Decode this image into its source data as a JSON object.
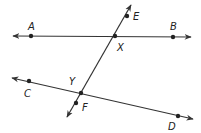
{
  "diagram": {
    "type": "geometry-lines",
    "colors": {
      "line": "#333333",
      "point": "#222222",
      "background": "#ffffff"
    },
    "lines": [
      {
        "name": "AB",
        "x1": 13,
        "y1": 36,
        "x2": 191,
        "y2": 37,
        "arrows": "both"
      },
      {
        "name": "CD",
        "x1": 12,
        "y1": 78,
        "x2": 193,
        "y2": 119,
        "arrows": "both"
      },
      {
        "name": "EF",
        "x1": 131,
        "y1": 5,
        "x2": 67,
        "y2": 117,
        "arrows": "both"
      }
    ],
    "points": [
      {
        "label": "A",
        "x": 31,
        "y": 36,
        "lx": 28,
        "ly": 30
      },
      {
        "label": "B",
        "x": 173,
        "y": 37,
        "lx": 170,
        "ly": 30
      },
      {
        "label": "X",
        "x": 115,
        "y": 36,
        "lx": 117,
        "ly": 51
      },
      {
        "label": "E",
        "x": 127,
        "y": 16,
        "lx": 133,
        "ly": 20
      },
      {
        "label": "Y",
        "x": 81,
        "y": 93,
        "lx": 69,
        "ly": 85
      },
      {
        "label": "F",
        "x": 76,
        "y": 103,
        "lx": 82,
        "ly": 111
      },
      {
        "label": "C",
        "x": 29,
        "y": 81,
        "lx": 24,
        "ly": 97
      },
      {
        "label": "D",
        "x": 178,
        "y": 116,
        "lx": 168,
        "ly": 130
      }
    ]
  }
}
